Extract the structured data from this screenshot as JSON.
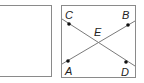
{
  "panels": [
    {
      "id": "left",
      "content": "empty"
    },
    {
      "id": "right",
      "content": "intersecting-lines"
    }
  ],
  "diagram": {
    "points": [
      {
        "label": "A",
        "x": 68,
        "y": 61
      },
      {
        "label": "B",
        "x": 128,
        "y": 25
      },
      {
        "label": "C",
        "x": 69,
        "y": 24
      },
      {
        "label": "D",
        "x": 126,
        "y": 62
      }
    ],
    "intersection_label": "E",
    "lines": [
      {
        "name": "AB",
        "through": [
          "A",
          "B"
        ]
      },
      {
        "name": "CD",
        "through": [
          "C",
          "D"
        ]
      }
    ],
    "colors": {
      "line": "#7a7a7a",
      "point": "#111111",
      "border": "#8a8a8a"
    }
  }
}
